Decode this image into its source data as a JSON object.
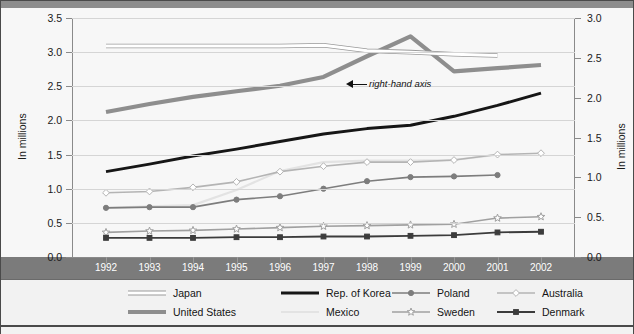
{
  "axes": {
    "left_title": "In millions",
    "right_title": "In millions",
    "left_ticks": [
      "0.0",
      "0.5",
      "1.0",
      "1.5",
      "2.0",
      "2.5",
      "3.0",
      "3.5"
    ],
    "right_ticks": [
      "0.0",
      "0.5.",
      "1.0",
      "1.5",
      "2.0",
      "2.5",
      "3.0"
    ],
    "left_range": [
      0.0,
      3.5
    ],
    "right_range": [
      0.0,
      3.0
    ]
  },
  "annotation": {
    "text": "right-hand axis"
  },
  "legend": {
    "items": [
      {
        "label": "Japan",
        "color": "#ffffff",
        "stroke": "#9a9a9a",
        "width": 3.0,
        "marker": "none",
        "row": 0,
        "col": 0
      },
      {
        "label": "Rep. of Korea",
        "color": "#161616",
        "stroke": "#161616",
        "width": 3.0,
        "marker": "none",
        "row": 0,
        "col": 1
      },
      {
        "label": "Poland",
        "color": "#7d7d7d",
        "stroke": "#7d7d7d",
        "width": 1.6,
        "marker": "circle-filled",
        "row": 0,
        "col": 2
      },
      {
        "label": "Australia",
        "color": "#b4b4b4",
        "stroke": "#b4b4b4",
        "width": 1.6,
        "marker": "diamond-open",
        "row": 0,
        "col": 3
      },
      {
        "label": "United States",
        "color": "#8e8e8e",
        "stroke": "#8e8e8e",
        "width": 4.2,
        "marker": "none",
        "row": 1,
        "col": 0
      },
      {
        "label": "Mexico",
        "color": "#e3e3e3",
        "stroke": "#c6c6c6",
        "width": 2.2,
        "marker": "none",
        "row": 1,
        "col": 1
      },
      {
        "label": "Sweden",
        "color": "#a0a0a0",
        "stroke": "#a0a0a0",
        "width": 1.6,
        "marker": "star-open",
        "row": 1,
        "col": 2
      },
      {
        "label": "Denmark",
        "color": "#3c3c3c",
        "stroke": "#3c3c3c",
        "width": 1.8,
        "marker": "square-filled",
        "row": 1,
        "col": 3
      }
    ]
  },
  "chart_data": {
    "type": "line",
    "title": "",
    "xlabel": "",
    "ylabel": "In millions",
    "y2label": "In millions",
    "ylim": [
      0.0,
      3.5
    ],
    "y2lim": [
      0.0,
      3.0
    ],
    "grid": true,
    "legend_position": "bottom",
    "categories": [
      "1992",
      "1993",
      "1994",
      "1995",
      "1996",
      "1997",
      "1998",
      "1999",
      "2000",
      "2001",
      "2002"
    ],
    "x": [
      1992,
      1993,
      1994,
      1995,
      1996,
      1997,
      1998,
      1999,
      2000,
      2001,
      2002
    ],
    "series": [
      {
        "name": "United States",
        "axis": "right",
        "note": "plotted on right-hand axis",
        "color": "#8e8e8e",
        "stroke": "#8e8e8e",
        "width": 4.2,
        "marker": "none",
        "values": [
          1.82,
          1.92,
          2.01,
          2.08,
          2.15,
          2.26,
          2.52,
          2.77,
          2.33,
          2.37,
          2.41
        ]
      },
      {
        "name": "Japan",
        "axis": "left",
        "color": "#ffffff",
        "stroke": "#9a9a9a",
        "width": 3.0,
        "marker": "none",
        "values": [
          3.09,
          3.09,
          3.09,
          3.09,
          3.09,
          3.1,
          3.02,
          3.0,
          2.97,
          2.95,
          null
        ]
      },
      {
        "name": "Rep. of Korea",
        "axis": "left",
        "color": "#161616",
        "stroke": "#161616",
        "width": 3.0,
        "marker": "none",
        "values": [
          1.25,
          1.36,
          1.48,
          1.58,
          1.69,
          1.8,
          1.88,
          1.93,
          2.06,
          2.22,
          2.4
        ]
      },
      {
        "name": "Mexico",
        "axis": "left",
        "color": "#e3e3e3",
        "stroke": "#c6c6c6",
        "width": 2.2,
        "marker": "none",
        "values": [
          0.72,
          0.74,
          0.76,
          0.98,
          1.26,
          1.39,
          1.41,
          1.41,
          1.42,
          1.5,
          null
        ]
      },
      {
        "name": "Australia",
        "axis": "left",
        "color": "#b4b4b4",
        "stroke": "#b4b4b4",
        "width": 1.6,
        "marker": "diamond-open",
        "values": [
          0.94,
          0.96,
          1.02,
          1.1,
          1.25,
          1.33,
          1.39,
          1.39,
          1.42,
          1.5,
          1.52
        ]
      },
      {
        "name": "Poland",
        "axis": "left",
        "color": "#7d7d7d",
        "stroke": "#7d7d7d",
        "width": 1.6,
        "marker": "circle-filled",
        "values": [
          0.72,
          0.73,
          0.73,
          0.84,
          0.89,
          1.0,
          1.11,
          1.17,
          1.18,
          1.2,
          null
        ]
      },
      {
        "name": "Sweden",
        "axis": "left",
        "color": "#a0a0a0",
        "stroke": "#a0a0a0",
        "width": 1.6,
        "marker": "star-open",
        "values": [
          0.36,
          0.38,
          0.39,
          0.41,
          0.43,
          0.45,
          0.46,
          0.47,
          0.48,
          0.57,
          0.59
        ]
      },
      {
        "name": "Denmark",
        "axis": "left",
        "color": "#3c3c3c",
        "stroke": "#3c3c3c",
        "width": 1.8,
        "marker": "square-filled",
        "values": [
          0.28,
          0.28,
          0.28,
          0.29,
          0.29,
          0.3,
          0.3,
          0.31,
          0.32,
          0.36,
          0.37
        ]
      }
    ]
  }
}
